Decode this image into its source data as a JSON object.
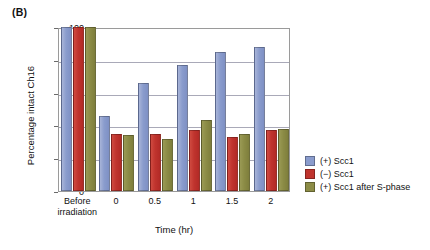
{
  "panel": {
    "label": "(B)"
  },
  "chart_data": {
    "type": "bar",
    "title": "",
    "subtitle": "",
    "xlabel": "Time (hr)",
    "ylabel": "Percentage intact Ch16",
    "ylim": [
      0,
      100
    ],
    "yticks": [
      0,
      20,
      40,
      60,
      80,
      100
    ],
    "ytick_labels": [
      "0",
      "20",
      "40",
      "60",
      "80",
      "100"
    ],
    "grid": true,
    "grid_axis": "y",
    "legend_position": "right",
    "categories": [
      "Before irradiation",
      "0",
      "0.5",
      "1",
      "1.5",
      "2"
    ],
    "series": [
      {
        "name": "(+) Scc1",
        "color": "#8a9ccd",
        "values": [
          100,
          46,
          66,
          77,
          85,
          88
        ]
      },
      {
        "name": "(−) Scc1",
        "color": "#c0342e",
        "values": [
          100,
          35,
          35,
          37,
          33,
          37
        ]
      },
      {
        "name": "(+) Scc1 after S-phase",
        "color": "#8c8c46",
        "values": [
          100,
          34,
          32,
          43,
          35,
          38
        ]
      }
    ]
  }
}
